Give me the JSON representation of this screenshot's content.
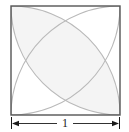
{
  "figure": {
    "type": "geometry-diagram",
    "square": {
      "side_label": "1",
      "x": 11,
      "y": 6,
      "size": 109,
      "stroke_color": "#555555",
      "stroke_width": 1.4,
      "fill_color": "#ffffff"
    },
    "arcs": {
      "count": 4,
      "description": "quarter circles of radius equal to the side, centered at each corner of the square",
      "radius_label": "1",
      "stroke_color": "#b9b9b9",
      "stroke_width": 1.1,
      "centers": [
        "top-left",
        "top-right",
        "bottom-right",
        "bottom-left"
      ]
    },
    "shaded_region": {
      "label": "",
      "location": "top-left lens between the two arcs centered at the top-right and bottom-left corners",
      "fill_color": "#f4f4f4"
    },
    "dimension": {
      "label": "1",
      "orientation": "horizontal",
      "placement": "below-square",
      "arrow_color": "#1a1a1a",
      "line_color": "#1a1a1a",
      "tick_color": "#1a1a1a",
      "y": 123,
      "x_start": 11,
      "x_end": 120
    },
    "background_color": "#ffffff"
  }
}
